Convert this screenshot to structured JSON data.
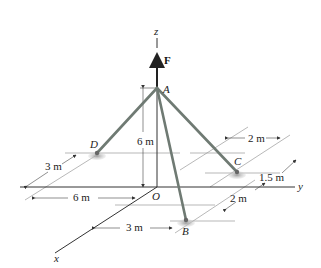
{
  "figure": {
    "axes": {
      "x": "x",
      "y": "y",
      "z": "z",
      "origin": "O"
    },
    "force": {
      "label": "F"
    },
    "points": {
      "A": "A",
      "B": "B",
      "C": "C",
      "D": "D"
    },
    "dimensions": {
      "height_A": "6 m",
      "D_offset_x": "3 m",
      "D_offset_y": "6 m",
      "B_offset_x": "3 m",
      "B_offset_y": "2 m",
      "C_offset_y": "2 m",
      "C_offset_x": "1.5 m"
    },
    "colors": {
      "member": "#6f7a73",
      "support": "#b9b9b9",
      "line": "#333333"
    }
  }
}
